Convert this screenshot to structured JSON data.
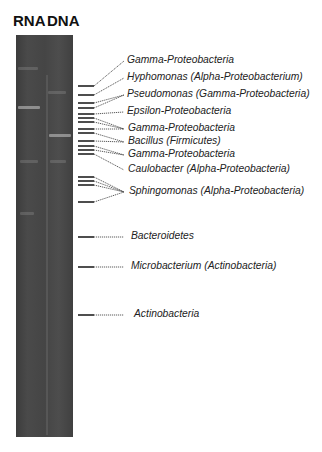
{
  "lanes": [
    {
      "label": "RNA",
      "x": 14
    },
    {
      "label": "DNA",
      "x": 46
    }
  ],
  "gel": {
    "background": "#454545",
    "bands": [
      {
        "lane": "RNA",
        "y": 67,
        "w": 20,
        "x": 2,
        "faint": true
      },
      {
        "lane": "RNA",
        "y": 106,
        "w": 22,
        "x": 2
      },
      {
        "lane": "DNA",
        "y": 91,
        "w": 18,
        "x": 32,
        "faint": true
      },
      {
        "lane": "DNA",
        "y": 134,
        "w": 22,
        "x": 33
      },
      {
        "lane": "RNA",
        "y": 160,
        "w": 18,
        "x": 4,
        "faint": true
      },
      {
        "lane": "DNA",
        "y": 160,
        "w": 16,
        "x": 34,
        "faint": true
      },
      {
        "lane": "RNA",
        "y": 212,
        "w": 14,
        "x": 4,
        "faint": true
      }
    ]
  },
  "markers": [
    {
      "tick_y": 86,
      "label": "Gamma-Proteobacteria",
      "label_y": 61
    },
    {
      "tick_y": 95,
      "label": "Hyphomonas (Alpha-Proteobacterium)",
      "label_y": 78
    },
    {
      "tick_y": 103,
      "label": "Pseudomonas (Gamma-Proteobacteria)",
      "label_y": 95
    },
    {
      "tick_y": 108,
      "label": "Pseudomonas (Gamma-Proteobacteria)",
      "label_y": 95
    },
    {
      "tick_y": 114,
      "label": "Epsilon-Proteobacteria",
      "label_y": 112
    },
    {
      "tick_y": 118,
      "label": "Gamma-Proteobacteria",
      "label_y": 129
    },
    {
      "tick_y": 122,
      "label": "Gamma-Proteobacteria",
      "label_y": 129
    },
    {
      "tick_y": 129,
      "label": "Gamma-Proteobacteria",
      "label_y": 129
    },
    {
      "tick_y": 133,
      "label": "Bacillus (Firmicutes)",
      "label_y": 142
    },
    {
      "tick_y": 141,
      "label": "Bacillus (Firmicutes)",
      "label_y": 142
    },
    {
      "tick_y": 146,
      "label": "Gamma-Proteobacteria",
      "label_y": 155
    },
    {
      "tick_y": 150,
      "label": "Gamma-Proteobacteria",
      "label_y": 155
    },
    {
      "tick_y": 154,
      "label": "Caulobacter (Alpha-Proteobacteria)",
      "label_y": 170
    },
    {
      "tick_y": 177,
      "label": "Sphingomonas (Alpha-Proteobacteria)",
      "label_y": 192
    },
    {
      "tick_y": 181,
      "label": "Sphingomonas (Alpha-Proteobacteria)",
      "label_y": 192
    },
    {
      "tick_y": 185,
      "label": "Sphingomonas (Alpha-Proteobacteria)",
      "label_y": 192
    },
    {
      "tick_y": 202,
      "label": "Sphingomonas (Alpha-Proteobacteria)",
      "label_y": 192
    },
    {
      "tick_y": 237,
      "label": "Bacteroidetes",
      "label_y": 237
    },
    {
      "tick_y": 267,
      "label": "Microbacterium (Actinobacteria)",
      "label_y": 267
    },
    {
      "tick_y": 315,
      "label": "Actinobacteria",
      "label_y": 315
    }
  ],
  "labels": [
    {
      "text": "Gamma-Proteobacteria",
      "x": 127,
      "y": 61
    },
    {
      "text": "Hyphomonas (Alpha-Proteobacterium)",
      "x": 127,
      "y": 78
    },
    {
      "text": "Pseudomonas (Gamma-Proteobacteria)",
      "x": 127,
      "y": 95
    },
    {
      "text": "Epsilon-Proteobacteria",
      "x": 127,
      "y": 112
    },
    {
      "text": "Gamma-Proteobacteria",
      "x": 128,
      "y": 129
    },
    {
      "text": "Bacillus (Firmicutes)",
      "x": 128,
      "y": 142
    },
    {
      "text": "Gamma-Proteobacteria",
      "x": 128,
      "y": 155
    },
    {
      "text": "Caulobacter (Alpha-Proteobacteria)",
      "x": 128,
      "y": 170
    },
    {
      "text": "Sphingomonas (Alpha-Proteobacteria)",
      "x": 129,
      "y": 192
    },
    {
      "text": "Bacteroidetes",
      "x": 131,
      "y": 237
    },
    {
      "text": "Microbacterium (Actinobacteria)",
      "x": 131,
      "y": 267
    },
    {
      "text": "Actinobacteria",
      "x": 134,
      "y": 315
    }
  ],
  "colors": {
    "tick": "#222222",
    "connector": "#333333",
    "text": "#222222"
  }
}
